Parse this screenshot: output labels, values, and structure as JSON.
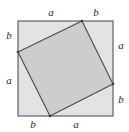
{
  "figure": {
    "name": "pythagorean-theorem-square-diagram",
    "canvas": {
      "width": 129,
      "height": 132,
      "background": "#ffffff"
    },
    "outer_square": {
      "label": "outer square",
      "x": 18,
      "y": 21,
      "width": 95,
      "height": 95,
      "fill": "#e3e3e3",
      "stroke": "#555555",
      "stroke_width": 1.1
    },
    "inner_square": {
      "label": "inner tilted square",
      "points": "82,21 113,84 50,116 18,52",
      "fill": "#cdcdcd",
      "stroke": "#4a4a4a",
      "stroke_width": 1.1
    },
    "labels": [
      {
        "id": "top-a",
        "text": "a",
        "x": 44,
        "y": 7,
        "side": "top",
        "segment": "long"
      },
      {
        "id": "top-b",
        "text": "b",
        "x": 89,
        "y": 7,
        "side": "top",
        "segment": "short"
      },
      {
        "id": "right-a",
        "text": "a",
        "x": 114,
        "y": 40,
        "side": "right",
        "segment": "long"
      },
      {
        "id": "right-b",
        "text": "b",
        "x": 114,
        "y": 94,
        "side": "right",
        "segment": "short"
      },
      {
        "id": "bottom-b",
        "text": "b",
        "x": 26,
        "y": 119,
        "side": "bottom",
        "segment": "short"
      },
      {
        "id": "bottom-a",
        "text": "a",
        "x": 69,
        "y": 119,
        "side": "bottom",
        "segment": "long"
      },
      {
        "id": "left-b",
        "text": "b",
        "x": 2,
        "y": 30,
        "side": "left",
        "segment": "short"
      },
      {
        "id": "left-a",
        "text": "a",
        "x": 2,
        "y": 75,
        "side": "left",
        "segment": "long"
      }
    ]
  },
  "chart_data": {
    "type": "diagram",
    "title": "",
    "variables": [
      "a",
      "b"
    ],
    "outer_square_side_segments": {
      "top": [
        "a",
        "b"
      ],
      "right": [
        "a",
        "b"
      ],
      "bottom": [
        "b",
        "a"
      ],
      "left": [
        "b",
        "a"
      ]
    },
    "annotations": [
      "a",
      "b",
      "a",
      "b",
      "b",
      "a",
      "b",
      "a"
    ]
  }
}
